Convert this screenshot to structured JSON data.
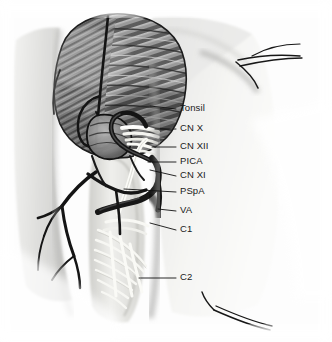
{
  "figure": {
    "view": "Left retrosigmoid / far-lateral suboccipital exposure",
    "background_color": "#fdfdfd",
    "ink_color": "#111111"
  },
  "labels": [
    {
      "id": "tonsil",
      "text": "Tonsil",
      "text_x": 180,
      "text_y": 111,
      "line": "M150,106 L176,109",
      "kind": "cerebellar-tonsil"
    },
    {
      "id": "cn10",
      "text": "CN X",
      "text_x": 180,
      "text_y": 131,
      "line": "M155,129 L176,129",
      "kind": "vagus-nerve"
    },
    {
      "id": "cn12",
      "text": "CN XII",
      "text_x": 180,
      "text_y": 149,
      "line": "M152,147 L176,147",
      "kind": "hypoglossal-nerve"
    },
    {
      "id": "pica",
      "text": "PICA",
      "text_x": 180,
      "text_y": 164,
      "line": "M148,162 L176,162",
      "kind": "posterior-inferior-cerebellar-artery"
    },
    {
      "id": "cn11",
      "text": "CN XI",
      "text_x": 180,
      "text_y": 178,
      "line": "M150,170 L176,176",
      "kind": "accessory-nerve"
    },
    {
      "id": "pspa",
      "text": "PSpA",
      "text_x": 180,
      "text_y": 194,
      "line": "M124,189 L176,192",
      "kind": "posterior-spinal-artery"
    },
    {
      "id": "va",
      "text": "VA",
      "text_x": 180,
      "text_y": 213,
      "line": "M158,209 L176,211",
      "kind": "vertebral-artery"
    },
    {
      "id": "c1",
      "text": "C1",
      "text_x": 180,
      "text_y": 232,
      "line": "M150,223 L176,230",
      "kind": "c1-nerve-root"
    },
    {
      "id": "c2",
      "text": "C2",
      "text_x": 180,
      "text_y": 280,
      "line": "M139,278 L176,278",
      "kind": "c2-nerve-root"
    }
  ],
  "structures": {
    "cerebellum": "cerebellar hemisphere with folia",
    "dura_flap": "reflected dural flap",
    "sutures": "retraction sutures",
    "rootlets": "spinal nerve rootlets",
    "vessels": "vertebral artery and branches"
  }
}
